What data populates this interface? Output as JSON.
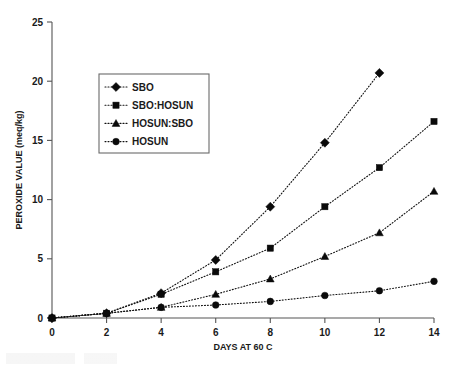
{
  "figure": {
    "background_color": "#ffffff",
    "foreground_color": "#111111",
    "axis_color": "#555555"
  },
  "chart_data": {
    "type": "line",
    "title": "",
    "subtitle": "",
    "xlabel": "DAYS AT 60 C",
    "ylabel": "PEROXIDE VALUE (meq/kg)",
    "x": [
      0,
      2,
      4,
      6,
      8,
      10,
      12,
      14
    ],
    "xlim": [
      0,
      14
    ],
    "ylim": [
      0,
      25
    ],
    "xticks": [
      "0",
      "2",
      "4",
      "6",
      "8",
      "10",
      "12",
      "14"
    ],
    "yticks": [
      "0",
      "5",
      "10",
      "15",
      "20",
      "25"
    ],
    "grid": false,
    "legend_position": "upper-left-inside",
    "series": [
      {
        "name": "SBO",
        "marker": "diamond",
        "linestyle": "dotted",
        "color": "#111111",
        "x": [
          0,
          2,
          4,
          6,
          8,
          10,
          12
        ],
        "values": [
          0.0,
          0.4,
          2.1,
          4.9,
          9.4,
          14.8,
          20.7
        ]
      },
      {
        "name": "SBO:HOSUN",
        "marker": "square",
        "linestyle": "dotted",
        "color": "#111111",
        "x": [
          0,
          2,
          4,
          6,
          8,
          10,
          12,
          14
        ],
        "values": [
          0.0,
          0.4,
          2.0,
          3.9,
          5.9,
          9.4,
          12.7,
          16.6
        ]
      },
      {
        "name": "HOSUN:SBO",
        "marker": "triangle",
        "linestyle": "dotted",
        "color": "#111111",
        "x": [
          0,
          2,
          4,
          6,
          8,
          10,
          12,
          14
        ],
        "values": [
          0.0,
          0.4,
          0.9,
          2.0,
          3.3,
          5.2,
          7.2,
          10.7
        ]
      },
      {
        "name": "HOSUN",
        "marker": "circle",
        "linestyle": "dotted",
        "color": "#111111",
        "x": [
          0,
          2,
          4,
          6,
          8,
          10,
          12,
          14
        ],
        "values": [
          0.0,
          0.4,
          0.9,
          1.1,
          1.4,
          1.9,
          2.3,
          3.1
        ]
      }
    ]
  },
  "legend": {
    "entries": [
      {
        "label": "SBO"
      },
      {
        "label": "SBO:HOSUN"
      },
      {
        "label": "HOSUN:SBO"
      },
      {
        "label": "HOSUN"
      }
    ]
  }
}
